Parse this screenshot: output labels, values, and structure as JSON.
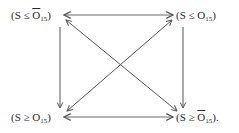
{
  "diagram": {
    "nodes": {
      "top_left": {
        "open": "(S ≤ ",
        "var": "O",
        "bar": true,
        "sub": "15",
        "close": ")"
      },
      "top_right": {
        "open": "(S ≤ ",
        "var": "O",
        "bar": false,
        "sub": "15",
        "close": ")"
      },
      "bottom_left": {
        "open": "(S ≥ ",
        "var": "O",
        "bar": false,
        "sub": "15",
        "close": ")"
      },
      "bottom_right": {
        "open": "(S ≥ ",
        "var": "O",
        "bar": true,
        "sub": "15",
        "close": ")."
      }
    },
    "edges": [
      {
        "from": "top_left",
        "to": "top_right",
        "style": "double-headed"
      },
      {
        "from": "top_left",
        "to": "bottom_left",
        "style": "single-headed"
      },
      {
        "from": "top_right",
        "to": "bottom_right",
        "style": "single-headed"
      },
      {
        "from": "top_left",
        "to": "bottom_right",
        "style": "double-headed"
      },
      {
        "from": "top_right",
        "to": "bottom_left",
        "style": "double-headed"
      },
      {
        "from": "bottom_left",
        "to": "bottom_right",
        "style": "double-headed"
      }
    ],
    "colors": {
      "line": "#555555",
      "text": "#2a2a2a"
    }
  }
}
